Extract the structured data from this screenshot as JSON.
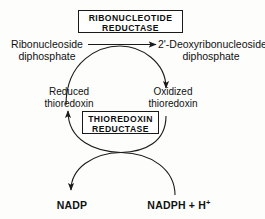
{
  "diagram": {
    "ink_color": "#1a1a1a",
    "background_color": "#fdfdfc"
  },
  "enzymes": {
    "top": {
      "line1": "RIBONUCLEOTIDE",
      "line2": "REDUCTASE"
    },
    "bottom": {
      "line1": "THIOREDOXIN",
      "line2": "REDUCTASE"
    }
  },
  "substrates": {
    "left": {
      "line1": "Ribonucleoside",
      "line2": "diphosphate"
    },
    "right": {
      "line1": "2'-Deoxyribonucleoside",
      "line2": "diphosphate"
    }
  },
  "cofactors": {
    "reduced": {
      "line1": "Reduced",
      "line2": "thioredoxin"
    },
    "oxidized": {
      "line1": "Oxidized",
      "line2": "thioredoxin"
    }
  },
  "nucleotides": {
    "left": "NADP",
    "right_base": "NADPH + H",
    "right_charge": "+"
  }
}
